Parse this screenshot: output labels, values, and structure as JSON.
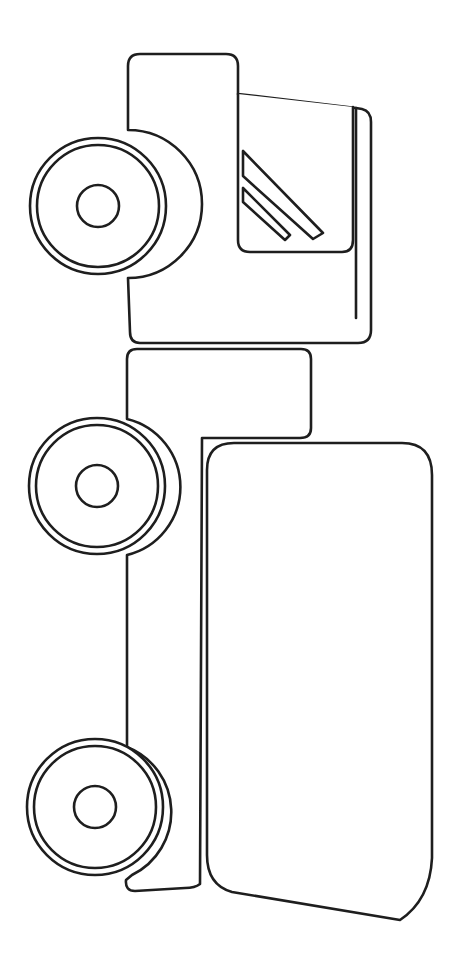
{
  "figure": {
    "title": "Truck coloring page",
    "subject": "truck",
    "orientation": "rotated 90 degrees, front facing up",
    "style": "black outline line art on white",
    "colors": {
      "background": "#ffffff",
      "line": "#1e1e1e"
    },
    "parts": [
      "cab",
      "window",
      "chassis",
      "cargo-box",
      "front-wheel",
      "middle-wheel",
      "rear-wheel"
    ]
  }
}
